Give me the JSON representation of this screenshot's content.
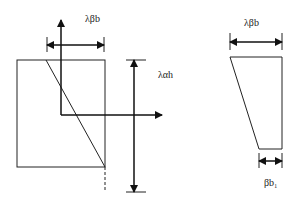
{
  "figure": {
    "left_section": {
      "width_dimension_label": "λβb",
      "height_dimension_label": "λαh"
    },
    "right_section": {
      "top_dimension_label": "λβb",
      "bottom_dimension_label": "βb₁"
    }
  },
  "colors": {
    "line": "#222222",
    "background": "#ffffff"
  }
}
